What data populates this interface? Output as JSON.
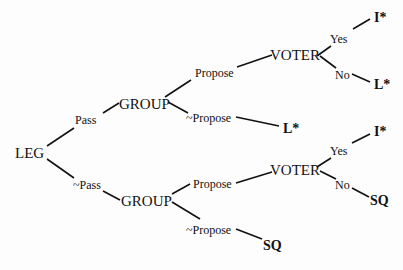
{
  "diagram": {
    "type": "game-tree",
    "nodes": [
      {
        "id": "leg",
        "label": "LEG",
        "x": 15,
        "y": 158,
        "cls": "big"
      },
      {
        "id": "pass",
        "label": "Pass",
        "x": 75,
        "y": 124,
        "cls": "small"
      },
      {
        "id": "not-pass",
        "label": "~Pass",
        "x": 73,
        "y": 189,
        "cls": "small"
      },
      {
        "id": "group-top",
        "label": "GROUP",
        "x": 119,
        "y": 109,
        "cls": "big"
      },
      {
        "id": "group-bottom",
        "label": "GROUP",
        "x": 121,
        "y": 206,
        "cls": "big"
      },
      {
        "id": "propose-top",
        "label": "Propose",
        "x": 195,
        "y": 77,
        "cls": "small"
      },
      {
        "id": "not-propose-top",
        "label": "~Propose",
        "x": 186,
        "y": 122,
        "cls": "small"
      },
      {
        "id": "outcome-l-mid",
        "label": "L*",
        "x": 283,
        "y": 133,
        "cls": "outcome"
      },
      {
        "id": "voter-top",
        "label": "VOTER",
        "x": 270,
        "y": 60,
        "cls": "big"
      },
      {
        "id": "yes-top",
        "label": "Yes",
        "x": 330,
        "y": 43,
        "cls": "small"
      },
      {
        "id": "no-top",
        "label": "No",
        "x": 335,
        "y": 79,
        "cls": "small"
      },
      {
        "id": "outcome-i-top",
        "label": "I*",
        "x": 374,
        "y": 22,
        "cls": "outcome"
      },
      {
        "id": "outcome-l-top",
        "label": "L*",
        "x": 374,
        "y": 89,
        "cls": "outcome"
      },
      {
        "id": "propose-bottom",
        "label": "Propose",
        "x": 193,
        "y": 188,
        "cls": "small"
      },
      {
        "id": "not-propose-bottom",
        "label": "~Propose",
        "x": 186,
        "y": 234,
        "cls": "small"
      },
      {
        "id": "outcome-sq-bottom",
        "label": "SQ",
        "x": 263,
        "y": 250,
        "cls": "outcome"
      },
      {
        "id": "voter-bottom",
        "label": "VOTER",
        "x": 270,
        "y": 175,
        "cls": "big"
      },
      {
        "id": "yes-bottom",
        "label": "Yes",
        "x": 330,
        "y": 155,
        "cls": "small"
      },
      {
        "id": "no-bottom",
        "label": "No",
        "x": 335,
        "y": 189,
        "cls": "small"
      },
      {
        "id": "outcome-i-bottom",
        "label": "I*",
        "x": 374,
        "y": 136,
        "cls": "outcome"
      },
      {
        "id": "outcome-sq-right",
        "label": "SQ",
        "x": 370,
        "y": 205,
        "cls": "outcome"
      }
    ],
    "edges": [
      {
        "from": "leg",
        "to": "pass",
        "x1": 47,
        "y1": 146,
        "x2": 74,
        "y2": 128
      },
      {
        "from": "leg",
        "to": "not-pass",
        "x1": 47,
        "y1": 159,
        "x2": 74,
        "y2": 178
      },
      {
        "from": "pass",
        "to": "group-top",
        "x1": 103,
        "y1": 113,
        "x2": 119,
        "y2": 103
      },
      {
        "from": "group-top",
        "to": "propose-top",
        "x1": 165,
        "y1": 97,
        "x2": 191,
        "y2": 80
      },
      {
        "from": "group-top",
        "to": "not-propose-top",
        "x1": 168,
        "y1": 102,
        "x2": 188,
        "y2": 113
      },
      {
        "from": "not-propose-top",
        "to": "outcome-l-mid",
        "x1": 236,
        "y1": 117,
        "x2": 279,
        "y2": 126
      },
      {
        "from": "propose-top",
        "to": "voter-top",
        "x1": 237,
        "y1": 67,
        "x2": 272,
        "y2": 55
      },
      {
        "from": "voter-top",
        "to": "yes-top",
        "x1": 317,
        "y1": 56,
        "x2": 331,
        "y2": 46
      },
      {
        "from": "voter-top",
        "to": "no-top",
        "x1": 320,
        "y1": 56,
        "x2": 336,
        "y2": 68
      },
      {
        "from": "yes-top",
        "to": "outcome-i-top",
        "x1": 353,
        "y1": 29,
        "x2": 370,
        "y2": 19
      },
      {
        "from": "no-top",
        "to": "outcome-l-top",
        "x1": 352,
        "y1": 74,
        "x2": 370,
        "y2": 82
      },
      {
        "from": "not-pass",
        "to": "group-bottom",
        "x1": 103,
        "y1": 191,
        "x2": 120,
        "y2": 200
      },
      {
        "from": "group-bottom",
        "to": "propose-bottom",
        "x1": 172,
        "y1": 194,
        "x2": 190,
        "y2": 184
      },
      {
        "from": "group-bottom",
        "to": "not-propose-bottom",
        "x1": 172,
        "y1": 202,
        "x2": 200,
        "y2": 219
      },
      {
        "from": "not-propose-bottom",
        "to": "outcome-sq-bottom",
        "x1": 236,
        "y1": 229,
        "x2": 262,
        "y2": 239
      },
      {
        "from": "propose-bottom",
        "to": "voter-bottom",
        "x1": 236,
        "y1": 183,
        "x2": 272,
        "y2": 172
      },
      {
        "from": "voter-bottom",
        "to": "yes-bottom",
        "x1": 317,
        "y1": 167,
        "x2": 331,
        "y2": 158
      },
      {
        "from": "voter-bottom",
        "to": "no-bottom",
        "x1": 320,
        "y1": 171,
        "x2": 336,
        "y2": 179
      },
      {
        "from": "yes-bottom",
        "to": "outcome-i-bottom",
        "x1": 352,
        "y1": 143,
        "x2": 370,
        "y2": 134
      },
      {
        "from": "no-bottom",
        "to": "outcome-sq-right",
        "x1": 352,
        "y1": 188,
        "x2": 369,
        "y2": 197
      }
    ]
  }
}
